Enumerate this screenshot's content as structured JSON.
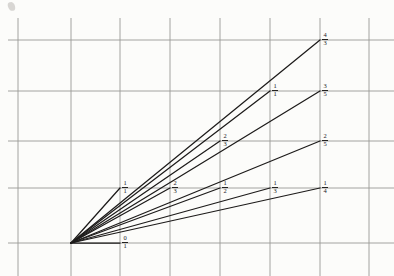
{
  "figure": {
    "background_color": "#fcfcfa",
    "grid_color": "#9a9a96",
    "ray_color": "#1d1b1a",
    "label_color": "#23211f",
    "origin": {
      "x": 71,
      "y": 243,
      "label": "origin"
    }
  },
  "grid": {
    "vertical_x": [
      18,
      71,
      120,
      170,
      220,
      270,
      320,
      369
    ],
    "horizontal_y": [
      40,
      91,
      141,
      188,
      243
    ],
    "spacing_px": 50,
    "line_width": 0.9
  },
  "chart_data": {
    "type": "line",
    "xlabel": "",
    "ylabel": "",
    "grid": true,
    "legend": "none",
    "origin_px": [
      71,
      243
    ],
    "xlim": [
      0,
      394
    ],
    "ylim": [
      276,
      0
    ],
    "rays": [
      {
        "label_num": "0",
        "label_den": "1",
        "fraction": "0/1",
        "slope": 0.0,
        "end_px": [
          120,
          243
        ],
        "label_px": [
          125,
          236
        ]
      },
      {
        "label_num": "1",
        "label_den": "4",
        "fraction": "1/4",
        "slope": 0.25,
        "end_px": [
          320,
          188
        ],
        "label_px": [
          325,
          181
        ]
      },
      {
        "label_num": "1",
        "label_den": "3",
        "fraction": "1/3",
        "slope": 0.333,
        "end_px": [
          270,
          188
        ],
        "label_px": [
          275,
          181
        ]
      },
      {
        "label_num": "1",
        "label_den": "2",
        "fraction": "1/2",
        "slope": 0.5,
        "end_px": [
          220,
          188
        ],
        "label_px": [
          225,
          181
        ]
      },
      {
        "label_num": "1",
        "label_den": "1",
        "fraction": "1/1",
        "slope": 1.0,
        "end_px": [
          120,
          188
        ],
        "label_px": [
          125,
          181
        ]
      },
      {
        "label_num": "2",
        "label_den": "3",
        "fraction": "2/3",
        "slope": 0.666,
        "end_px": [
          170,
          188
        ],
        "label_px": [
          175,
          181
        ]
      },
      {
        "label_num": "2",
        "label_den": "5",
        "fraction": "2/5",
        "slope": 0.4,
        "end_px": [
          320,
          141
        ],
        "label_px": [
          325,
          134
        ]
      },
      {
        "label_num": "2",
        "label_den": "3",
        "fraction": "2/3",
        "slope": 0.666,
        "end_px": [
          220,
          141
        ],
        "label_px": [
          225,
          134
        ]
      },
      {
        "label_num": "3",
        "label_den": "5",
        "fraction": "3/5",
        "slope": 0.6,
        "end_px": [
          320,
          91
        ],
        "label_px": [
          325,
          84
        ]
      },
      {
        "label_num": "1",
        "label_den": "1",
        "fraction": "1/1",
        "slope": 1.0,
        "end_px": [
          270,
          91
        ],
        "label_px": [
          275,
          84
        ]
      },
      {
        "label_num": "4",
        "label_den": "3",
        "fraction": "4/3",
        "slope": 1.333,
        "end_px": [
          320,
          40
        ],
        "label_px": [
          325,
          33
        ]
      }
    ],
    "labels": [
      {
        "text": "0/1",
        "x": 125,
        "y": 236
      },
      {
        "text": "1/1",
        "x": 125,
        "y": 181
      },
      {
        "text": "1/2",
        "x": 225,
        "y": 181
      },
      {
        "text": "2/3",
        "x": 175,
        "y": 181
      },
      {
        "text": "1/3",
        "x": 275,
        "y": 181
      },
      {
        "text": "1/4",
        "x": 325,
        "y": 181
      },
      {
        "text": "2/3",
        "x": 225,
        "y": 134
      },
      {
        "text": "2/5",
        "x": 325,
        "y": 134
      },
      {
        "text": "1/1",
        "x": 275,
        "y": 84
      },
      {
        "text": "3/5",
        "x": 325,
        "y": 84
      },
      {
        "text": "4/3",
        "x": 325,
        "y": 33
      }
    ]
  }
}
